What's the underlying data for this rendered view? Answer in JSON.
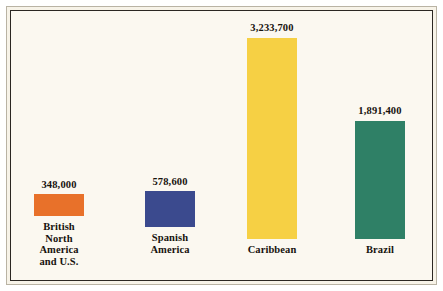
{
  "figure": {
    "background_color": "#fbf8f0",
    "frame_color": "#2b2722",
    "text_color": "#17130e"
  },
  "chart_data": {
    "type": "bar",
    "title": "",
    "subtitle": "",
    "xlabel": "",
    "ylabel": "",
    "grid": false,
    "legend": "none",
    "ylim": [
      0,
      3233700
    ],
    "categories": [
      "British North\nAmerica and U.S.",
      "Spanish America",
      "Caribbean",
      "Brazil"
    ],
    "values": [
      348000,
      578600,
      3233700,
      1891400
    ],
    "value_labels": [
      "348,000",
      "578,600",
      "3,233,700",
      "1,891,400"
    ],
    "colors": [
      "#e8712a",
      "#3b4a8e",
      "#f6d044",
      "#2f8066"
    ]
  },
  "bars": [
    {
      "label": "British North\nAmerica and U.S.",
      "value_label": "348,000",
      "value": 348000,
      "color": "#e8712a"
    },
    {
      "label": "Spanish America",
      "value_label": "578,600",
      "value": 578600,
      "color": "#3b4a8e"
    },
    {
      "label": "Caribbean",
      "value_label": "3,233,700",
      "value": 3233700,
      "color": "#f6d044"
    },
    {
      "label": "Brazil",
      "value_label": "1,891,400",
      "value": 1891400,
      "color": "#2f8066"
    }
  ]
}
